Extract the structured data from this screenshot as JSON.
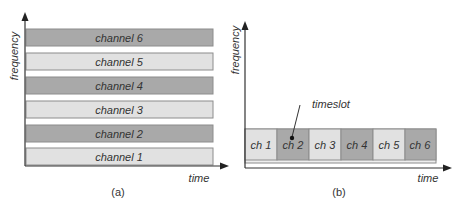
{
  "colors": {
    "dark_fill": "#a9a9a9",
    "light_fill": "#e1e1e1",
    "stroke": "#8c8c8c",
    "axis": "#333333",
    "text": "#333333"
  },
  "figure_a": {
    "caption": "(a)",
    "y_axis_label": "frequency",
    "x_axis_label": "time",
    "channels": [
      {
        "label": "channel 6",
        "shade": "dark"
      },
      {
        "label": "channel 5",
        "shade": "light"
      },
      {
        "label": "channel 4",
        "shade": "dark"
      },
      {
        "label": "channel 3",
        "shade": "light"
      },
      {
        "label": "channel 2",
        "shade": "dark"
      },
      {
        "label": "channel 1",
        "shade": "light"
      }
    ]
  },
  "figure_b": {
    "caption": "(b)",
    "y_axis_label": "frequency",
    "x_axis_label": "time",
    "annotation": "timeslot",
    "slots": [
      {
        "label": "ch 1",
        "shade": "light"
      },
      {
        "label": "ch 2",
        "shade": "dark"
      },
      {
        "label": "ch 3",
        "shade": "light"
      },
      {
        "label": "ch 4",
        "shade": "dark"
      },
      {
        "label": "ch 5",
        "shade": "light"
      },
      {
        "label": "ch 6",
        "shade": "dark"
      }
    ]
  }
}
